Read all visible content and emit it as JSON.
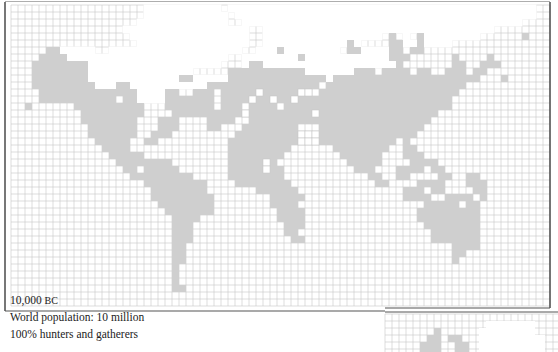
{
  "caption": {
    "era": "10,000",
    "era_suffix": "BC",
    "population": "World population: 10 million",
    "lifestyle": "100% hunters and gatherers"
  },
  "colors": {
    "land": "#cfcfcf",
    "ice": "#ffffff",
    "grid": "#c8c8c8",
    "frame": "#555555"
  },
  "grid": {
    "x0": 11,
    "y0": 5,
    "cell": 7,
    "cols": 77,
    "rows": 43
  },
  "land_runs": [
    [
      18,
      [
        [
          18,
          19
        ]
      ]
    ],
    [
      19,
      [
        [
          16,
          18
        ]
      ]
    ],
    [
      20,
      [
        [
          15,
          17
        ],
        [
          46,
          47
        ]
      ]
    ],
    [
      21,
      [
        [
          14,
          16
        ],
        [
          46,
          47
        ]
      ]
    ],
    [
      22,
      [
        [
          13,
          15
        ],
        [
          45,
          46
        ]
      ]
    ],
    [
      23,
      [
        [
          13,
          15
        ],
        [
          44,
          46
        ]
      ]
    ],
    [
      24,
      [
        [
          13,
          14
        ]
      ]
    ]
  ]
}
